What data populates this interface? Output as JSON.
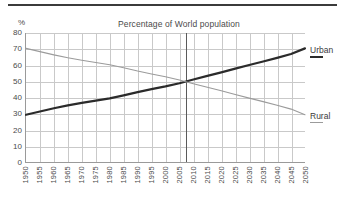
{
  "figure": {
    "top_rule": "horizontal-rule",
    "unit_label": "%",
    "title": "Percentage of World population"
  },
  "legend": {
    "position": "right",
    "items": [
      {
        "label": "Urban",
        "color": "#2b2b2b",
        "swatch": "thick-line"
      },
      {
        "label": "Rural",
        "color": "#9b9b9b",
        "swatch": "thin-line"
      }
    ]
  },
  "chart_data": {
    "type": "line",
    "title": "Percentage of World population",
    "xlabel": "",
    "ylabel": "%",
    "ylim": [
      0,
      80
    ],
    "ytick_step": 10,
    "yticks": [
      0,
      10,
      20,
      30,
      40,
      50,
      60,
      70,
      80
    ],
    "grid": true,
    "legend_position": "right",
    "categories": [
      "1950",
      "1955",
      "1960",
      "1965",
      "1970",
      "1975",
      "1980",
      "1985",
      "1990",
      "1995",
      "2000",
      "2005",
      "2010",
      "2015",
      "2020",
      "2025",
      "2030",
      "2035",
      "2040",
      "2045",
      "2050"
    ],
    "x": [
      1950,
      1955,
      1960,
      1965,
      1970,
      1975,
      1980,
      1985,
      1990,
      1995,
      2000,
      2005,
      2010,
      2015,
      2020,
      2025,
      2030,
      2035,
      2040,
      2045,
      2050
    ],
    "series": [
      {
        "name": "Urban",
        "color": "#2b2b2b",
        "values": [
          29.5,
          31.5,
          33.5,
          35.3,
          36.8,
          38.2,
          39.6,
          41.5,
          43.5,
          45.3,
          47.0,
          49.0,
          51.3,
          53.5,
          55.7,
          58.0,
          60.2,
          62.4,
          64.6,
          67.0,
          70.5
        ]
      },
      {
        "name": "Rural",
        "color": "#9b9b9b",
        "values": [
          70.5,
          68.5,
          66.5,
          64.7,
          63.2,
          61.8,
          60.4,
          58.5,
          56.5,
          54.7,
          53.0,
          51.0,
          48.7,
          46.5,
          44.3,
          42.0,
          39.8,
          37.6,
          35.4,
          33.0,
          29.5
        ]
      }
    ],
    "annotations": [
      {
        "type": "vertical-line",
        "x": 2007,
        "label": "",
        "color": "#5a5a5a",
        "note": "crossover year where Urban and Rural both reach 50%"
      }
    ]
  }
}
